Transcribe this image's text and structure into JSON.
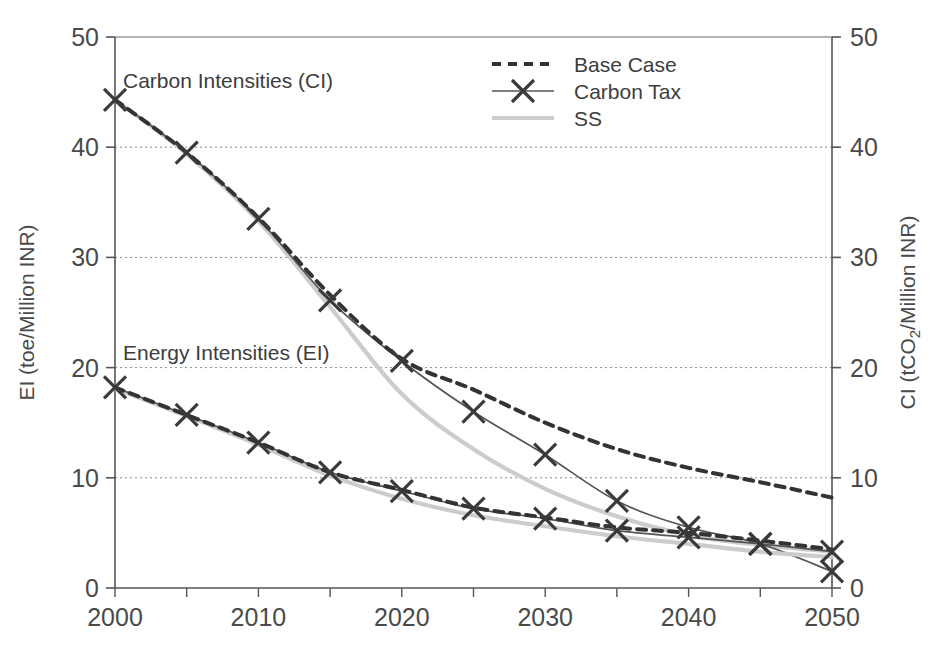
{
  "figure": {
    "background": "#ffffff",
    "ink_color": "#4a4a4a"
  },
  "annotations": {
    "carbon_intensities": "Carbon Intensities (CI)",
    "energy_intensities": "Energy Intensities (EI)"
  },
  "legend": {
    "position": "top-center",
    "entries": [
      {
        "label": "Base Case",
        "style": "dashed",
        "color": "#333333",
        "marker": "none"
      },
      {
        "label": "Carbon Tax",
        "style": "solid",
        "color": "#555555",
        "marker": "x"
      },
      {
        "label": "SS",
        "style": "solid",
        "color": "#cccccc",
        "marker": "none"
      }
    ]
  },
  "axes": {
    "left_title": "EI (toe/Million INR)",
    "right_title_prefix": "CI (tCO",
    "right_title_sub": "2",
    "right_title_suffix": "/Million INR)",
    "x_ticks": [
      "2000",
      "2010",
      "2020",
      "2030",
      "2040",
      "2050"
    ],
    "y_ticks": [
      "0",
      "10",
      "20",
      "30",
      "40",
      "50"
    ],
    "ylim": [
      0,
      50
    ],
    "xlim": [
      2000,
      2050
    ],
    "minor_tick_step": 5,
    "grid": "horizontal dotted"
  },
  "chart_data": {
    "type": "line",
    "title": "",
    "xlabel": "",
    "ylabel": "EI (toe/Million INR)",
    "y2label": "CI (tCO2/Million INR)",
    "xlim": [
      2000,
      2050
    ],
    "ylim": [
      0,
      50
    ],
    "y2lim": [
      0,
      50
    ],
    "grid": true,
    "legend_position": "top-center",
    "x": [
      2000,
      2005,
      2010,
      2015,
      2020,
      2025,
      2030,
      2035,
      2040,
      2045,
      2050
    ],
    "groups": [
      {
        "group": "Carbon Intensities (CI)",
        "axis": "right",
        "series": [
          {
            "name": "Base Case",
            "style": "dashed",
            "color": "#333333",
            "marker": "none",
            "values": [
              44.3,
              39.5,
              33.6,
              26.6,
              20.8,
              18.0,
              15.0,
              12.6,
              10.9,
              9.6,
              8.2
            ]
          },
          {
            "name": "Carbon Tax",
            "style": "solid",
            "color": "#555555",
            "marker": "x",
            "values": [
              44.3,
              39.5,
              33.5,
              26.1,
              20.6,
              16.0,
              12.1,
              7.9,
              5.5,
              4.0,
              1.5
            ]
          },
          {
            "name": "SS",
            "style": "solid",
            "color": "#cccccc",
            "marker": "none",
            "values": [
              44.3,
              39.4,
              33.3,
              25.5,
              17.6,
              12.6,
              9.0,
              6.5,
              4.8,
              3.9,
              3.3
            ]
          }
        ]
      },
      {
        "group": "Energy Intensities (EI)",
        "axis": "left",
        "series": [
          {
            "name": "Base Case",
            "style": "dashed",
            "color": "#333333",
            "marker": "none",
            "values": [
              18.2,
              15.7,
              13.2,
              10.5,
              8.9,
              7.3,
              6.4,
              5.5,
              5.0,
              4.3,
              3.5
            ]
          },
          {
            "name": "Carbon Tax",
            "style": "solid",
            "color": "#555555",
            "marker": "x",
            "values": [
              18.2,
              15.7,
              13.2,
              10.5,
              8.8,
              7.2,
              6.3,
              5.2,
              4.6,
              4.0,
              3.3
            ]
          },
          {
            "name": "SS",
            "style": "solid",
            "color": "#cccccc",
            "marker": "none",
            "values": [
              18.1,
              15.6,
              13.0,
              10.2,
              8.1,
              6.6,
              5.6,
              4.7,
              4.0,
              3.3,
              2.8
            ]
          }
        ]
      }
    ]
  }
}
